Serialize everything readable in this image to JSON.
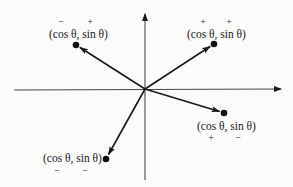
{
  "diagram": {
    "colors": {
      "background": "#fbfbfa",
      "ink": "#1a1a1a"
    },
    "axes": {
      "origin": [
        145,
        89
      ],
      "x_axis": {
        "from": [
          14,
          90
        ],
        "to": [
          281,
          89
        ]
      },
      "y_axis": {
        "from": [
          145,
          180
        ],
        "to": [
          145,
          14
        ]
      }
    },
    "points": [
      {
        "id": "upper-left",
        "quadrant": "II",
        "label": "(cos θ, sin θ)",
        "cos_sign": "−",
        "sin_sign": "+",
        "dot": [
          76,
          45
        ]
      },
      {
        "id": "upper-right",
        "quadrant": "I",
        "label": "(cos θ, sin θ)",
        "cos_sign": "+",
        "sin_sign": "+",
        "dot": [
          214,
          44
        ]
      },
      {
        "id": "lower-right",
        "quadrant": "IV",
        "label": "(cos θ, sin θ)",
        "cos_sign": "+",
        "sin_sign": "−",
        "dot": [
          224,
          113
        ]
      },
      {
        "id": "lower-left",
        "quadrant": "III",
        "label": "(cos θ, sin θ)",
        "cos_sign": "−",
        "sin_sign": "−",
        "dot": [
          106,
          159
        ]
      }
    ]
  }
}
